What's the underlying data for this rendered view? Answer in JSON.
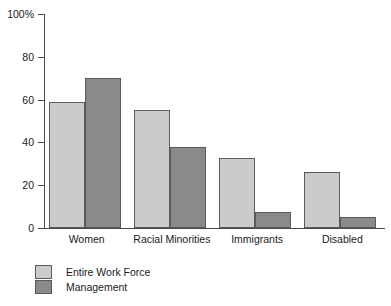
{
  "chart_data": {
    "type": "bar",
    "title": "",
    "subtitle": "",
    "xlabel": "",
    "ylabel": "",
    "ylim": [
      0,
      100
    ],
    "yticks": [
      0,
      20,
      40,
      60,
      80,
      100
    ],
    "ytick_labels": [
      "0",
      "20",
      "40",
      "60",
      "80",
      "100%"
    ],
    "grid": false,
    "legend_position": "bottom-left",
    "categories": [
      "Women",
      "Racial Minorities",
      "Immigrants",
      "Disabled"
    ],
    "series": [
      {
        "name": "Entire Work Force",
        "color": "#cbcbcb",
        "values": [
          59,
          55,
          32.5,
          26
        ]
      },
      {
        "name": "Management",
        "color": "#8a8a8a",
        "values": [
          70,
          38,
          7.5,
          5
        ]
      }
    ]
  },
  "axis": {
    "line_color": "#4a4a4a"
  },
  "legend": {
    "items": [
      {
        "label": "Entire Work Force",
        "swatch": "light"
      },
      {
        "label": "Management",
        "swatch": "dark"
      }
    ]
  }
}
